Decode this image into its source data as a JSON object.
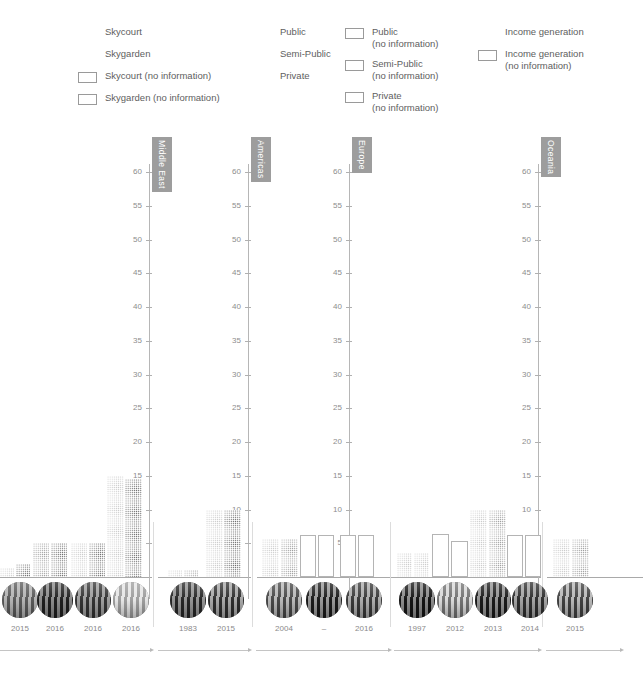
{
  "legend": {
    "columns": [
      {
        "x": 78,
        "width": 170,
        "items": [
          {
            "swatch": "skycourt-pattern",
            "label": "Skycourt"
          },
          {
            "swatch": "skygarden-pattern",
            "label": "Skygarden"
          },
          {
            "swatch": "empty-box",
            "label": "Skycourt (no information)"
          },
          {
            "swatch": "empty-box",
            "label": "Skygarden (no information)"
          }
        ]
      },
      {
        "x": 253,
        "width": 88,
        "items": [
          {
            "swatch": "public-pattern",
            "label": "Public"
          },
          {
            "swatch": "semi-public-pattern",
            "label": "Semi-Public"
          },
          {
            "swatch": "private-pattern",
            "label": "Private"
          }
        ]
      },
      {
        "x": 345,
        "width": 128,
        "items": [
          {
            "swatch": "empty-box",
            "label": "Public\n(no information)"
          },
          {
            "swatch": "empty-box",
            "label": "Semi-Public\n(no information)"
          },
          {
            "swatch": "empty-box",
            "label": "Private\n(no information)"
          }
        ]
      },
      {
        "x": 478,
        "width": 160,
        "items": [
          {
            "swatch": "income-pattern",
            "label": "Income generation"
          },
          {
            "swatch": "empty-box",
            "label": "Income generation\n(no information)"
          }
        ]
      }
    ]
  },
  "chart_data": {
    "type": "bar",
    "title": "",
    "xlabel": "",
    "ylabel": "",
    "ylim": [
      0,
      62
    ],
    "yticks": [
      5,
      10,
      15,
      20,
      25,
      30,
      35,
      40,
      45,
      50,
      55,
      60
    ],
    "grid": false,
    "legend_position": "top",
    "series_names": [
      "Skycourt",
      "Skygarden"
    ],
    "panels": [
      {
        "name": "Middle East",
        "groups": [
          {
            "year": "2015",
            "values": [
              1.4,
              2.0
            ],
            "kinds": [
              "light",
              "dark"
            ]
          },
          {
            "year": "2016",
            "values": [
              5.0,
              5.0
            ],
            "kinds": [
              "mid",
              "dark"
            ]
          },
          {
            "year": "2016",
            "values": [
              5.0,
              5.0
            ],
            "kinds": [
              "light",
              "dark"
            ]
          },
          {
            "year": "2016",
            "values": [
              15.0,
              14.5
            ],
            "kinds": [
              "light",
              "dark"
            ]
          }
        ]
      },
      {
        "name": "Americas",
        "groups": [
          {
            "year": "1983",
            "values": [
              1.1,
              1.1
            ],
            "kinds": [
              "light",
              "mid"
            ]
          },
          {
            "year": "2015",
            "values": [
              10.0,
              10.0
            ],
            "kinds": [
              "light",
              "dark"
            ]
          }
        ]
      },
      {
        "name": "Europe",
        "groups": [
          {
            "year": "2004",
            "values": [
              5.7,
              5.7
            ],
            "kinds": [
              "light",
              "mid"
            ]
          },
          {
            "year": "–",
            "values": [
              6.2,
              6.2
            ],
            "kinds": [
              "none",
              "none"
            ]
          },
          {
            "year": "2016",
            "values": [
              6.2,
              6.2
            ],
            "kinds": [
              "none",
              "none"
            ]
          }
        ]
      },
      {
        "name": "Europe2",
        "groups": [
          {
            "year": "1997",
            "values": [
              3.6,
              3.6
            ],
            "kinds": [
              "light",
              "light"
            ]
          },
          {
            "year": "2012",
            "values": [
              6.3,
              5.3
            ],
            "kinds": [
              "none",
              "none"
            ]
          },
          {
            "year": "2013",
            "values": [
              10.0,
              10.0
            ],
            "kinds": [
              "light",
              "mid"
            ]
          },
          {
            "year": "2014",
            "values": [
              6.2,
              6.2
            ],
            "kinds": [
              "none",
              "none"
            ]
          }
        ]
      },
      {
        "name": "Oceania",
        "groups": [
          {
            "year": "2015",
            "values": [
              5.6,
              5.6
            ],
            "kinds": [
              "light",
              "mid"
            ]
          }
        ]
      }
    ]
  },
  "panel_titles": [
    "Middle East",
    "Americas",
    "Europe",
    "Oceania"
  ]
}
